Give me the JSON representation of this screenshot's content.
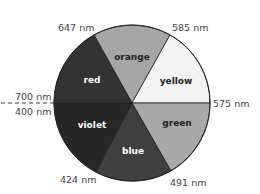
{
  "diagram": {
    "type": "color-wheel",
    "segments": [
      {
        "name": "orange",
        "color": "#a6a6a6",
        "text_color": "#222222"
      },
      {
        "name": "yellow",
        "color": "#f3f3f3",
        "text_color": "#222222"
      },
      {
        "name": "green",
        "color": "#a9a9a9",
        "text_color": "#222222"
      },
      {
        "name": "blue",
        "color": "#3f3f3f",
        "text_color": "#ffffff"
      },
      {
        "name": "violet",
        "color": "#262626",
        "text_color": "#ffffff"
      },
      {
        "name": "red",
        "color": "#333333",
        "text_color": "#ffffff"
      }
    ],
    "wavelength_labels": {
      "red_orange": "647 nm",
      "orange_yellow": "585 nm",
      "yellow_green": "575 nm",
      "green_blue": "491 nm",
      "blue_violet": "424 nm",
      "red_top": "700 nm",
      "violet_bottom": "400 nm"
    }
  }
}
